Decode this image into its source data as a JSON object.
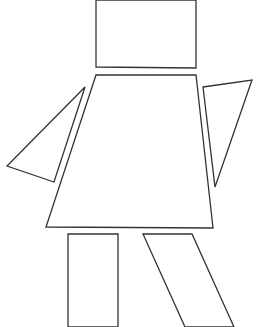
{
  "figure": {
    "stroke_color": "#333333",
    "fill_color": "#ffffff",
    "shapes": {
      "head": {
        "type": "rectangle",
        "points": "96,0 196,0 196,68 96,67"
      },
      "torso": {
        "type": "trapezoid",
        "points": "96,75 196,75 213,228 46,227"
      },
      "left_arm": {
        "type": "triangle",
        "points": "85,87 7,166 54,182"
      },
      "right_arm": {
        "type": "triangle",
        "points": "203,87 252,80 215,187"
      },
      "left_leg": {
        "type": "rectangle",
        "points": "68,234 118,234 118,327 68,327"
      },
      "right_leg": {
        "type": "parallelogram",
        "points": "143,234 192,234 234,327 185,327"
      }
    }
  }
}
